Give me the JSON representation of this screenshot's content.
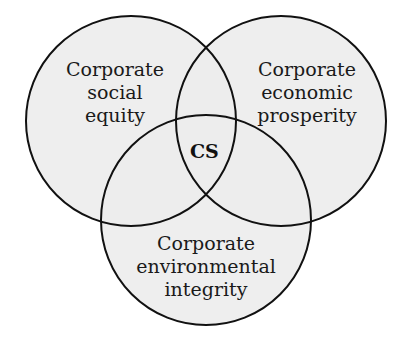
{
  "diagram": {
    "type": "venn",
    "colors": {
      "fill": "#ececec",
      "stroke": "#111111",
      "background": "#ffffff"
    },
    "circles": [
      {
        "id": "social",
        "lines": [
          "Corporate",
          "social",
          "equity"
        ]
      },
      {
        "id": "economic",
        "lines": [
          "Corporate",
          "economic",
          "prosperity"
        ]
      },
      {
        "id": "environmental",
        "lines": [
          "Corporate",
          "environmental",
          "integrity"
        ]
      }
    ],
    "center_label": "CS"
  }
}
